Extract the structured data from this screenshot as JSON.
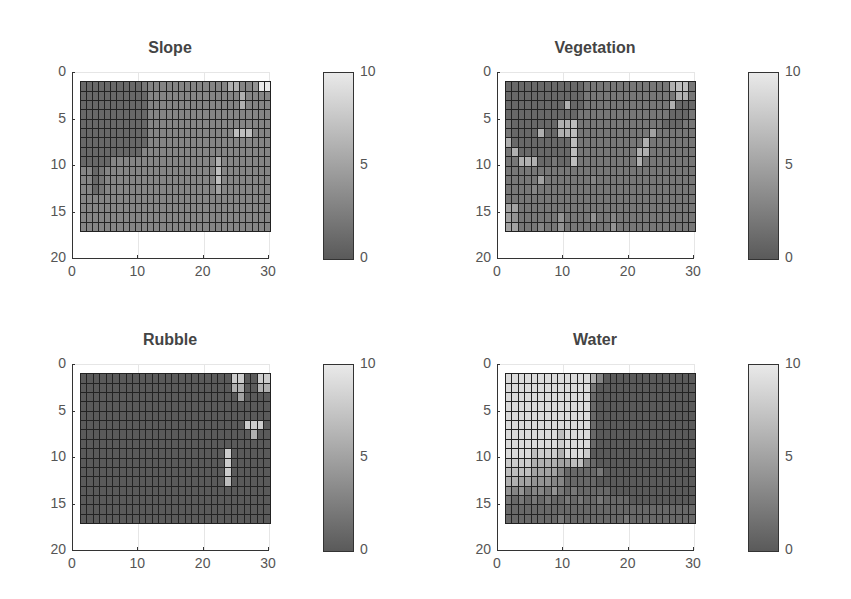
{
  "figure": {
    "panels": [
      {
        "title": "Slope"
      },
      {
        "title": "Vegetation"
      },
      {
        "title": "Rubble"
      },
      {
        "title": "Water"
      }
    ]
  },
  "chart_data": [
    {
      "type": "heatmap",
      "title": "Slope",
      "xlim": [
        0,
        30
      ],
      "ylim": [
        20,
        0
      ],
      "xticks": [
        "0",
        "10",
        "20",
        "30"
      ],
      "yticks": [
        "0",
        "5",
        "10",
        "15",
        "20"
      ],
      "colorbar": {
        "range": [
          0,
          10
        ],
        "ticks": [
          "0",
          "5",
          "10"
        ],
        "colormap": "gray"
      },
      "grid_extent": {
        "x": [
          1,
          30
        ],
        "y": [
          1,
          17
        ]
      },
      "rows": [
        "11111111112333333333333366334aa",
        "1111111111133333333333333363333",
        "1111111111133333333333333363333",
        "1111111111133333333333333333333",
        "1111111111133333333333333333333",
        "1111111111133333333333333777333",
        "1111111111133333333333333333333",
        "1111111111333333333333333333333",
        "1111133333333333333333633333333",
        "3312333333333333333333733333333",
        "3312333333333333333333733333333",
        "3312333333333333333333533333333",
        "3333333333333333333333333333333",
        "3333333333333333333333333333333",
        "3333333333333333333333333333333",
        "3333333333333333333333333333333"
      ]
    },
    {
      "type": "heatmap",
      "title": "Vegetation",
      "xlim": [
        0,
        30
      ],
      "ylim": [
        20,
        0
      ],
      "xticks": [
        "0",
        "10",
        "20",
        "30"
      ],
      "yticks": [
        "0",
        "5",
        "10",
        "15",
        "20"
      ],
      "colorbar": {
        "range": [
          0,
          10
        ],
        "ticks": [
          "0",
          "5",
          "10"
        ],
        "colormap": "gray"
      },
      "grid_extent": {
        "x": [
          1,
          30
        ],
        "y": [
          1,
          17
        ]
      },
      "rows": [
        "11111111111122222222222226772",
        "11111111111122222222222222662",
        "11111111161122222222222226111",
        "11111111111222222222222221112",
        "21111111667222222222222211122",
        "21111611667222222222225222222",
        "61111111117222222222262222222",
        "26111111117222222222662222222",
        "22666112117222222222622222222",
        "22222222222222222222222222222",
        "22222522222223222222222222222",
        "22223222222222222222222222222",
        "22222222222222222222222222222",
        "55222222222222222222222222222",
        "54222222422224223222222222222",
        "55222322422222224222222222222"
      ]
    },
    {
      "type": "heatmap",
      "title": "Rubble",
      "xlim": [
        0,
        30
      ],
      "ylim": [
        20,
        0
      ],
      "xticks": [
        "0",
        "10",
        "20",
        "30"
      ],
      "yticks": [
        "0",
        "5",
        "10",
        "15",
        "20"
      ],
      "colorbar": {
        "range": [
          0,
          10
        ],
        "ticks": [
          "0",
          "5",
          "10"
        ],
        "colormap": "gray"
      },
      "grid_extent": {
        "x": [
          1,
          30
        ],
        "y": [
          1,
          17
        ]
      },
      "rows": [
        "00000000000000000000000880088",
        "00000000000000000000000660066",
        "00000000000000000000000050000",
        "00000000000000000000000000000",
        "00000000000000000000000000000",
        "00000000000000000000000008880",
        "00000000000000000000000000600",
        "00000000000000000000000000000",
        "00000000000000000000008000000",
        "00000000000000000000008000000",
        "00000000000000000000008000000",
        "00000000000000000000007000000",
        "00000000000000000000000000000",
        "00000000000000000000000000000",
        "00000000000000000000000000000",
        "00000000000000000000000000000"
      ]
    },
    {
      "type": "heatmap",
      "title": "Water",
      "xlim": [
        0,
        30
      ],
      "ylim": [
        20,
        0
      ],
      "xticks": [
        "0",
        "10",
        "20",
        "30"
      ],
      "yticks": [
        "0",
        "5",
        "10",
        "15",
        "20"
      ],
      "colorbar": {
        "range": [
          0,
          10
        ],
        "ticks": [
          "0",
          "5",
          "10"
        ],
        "colormap": "gray"
      },
      "grid_extent": {
        "x": [
          1,
          30
        ],
        "y": [
          1,
          17
        ]
      },
      "rows": [
        "99999999999996300000000000000",
        "99999999999992000000000000000",
        "99999999999991000000000000000",
        "99999999999991000000000000000",
        "99999999999991000000000000000",
        "99999999999991000000000000000",
        "99999999799991000000000000000",
        "99999999899991000000000000000",
        "99997888699980000000000000000",
        "88886666557731000000000000000",
        "77775555311111200000000000000",
        "66554443311111000000000000000",
        "43423324212111110000000000000",
        "21212121121211211110000000000",
        "11111111111111111111111111111",
        "11111111211111111121111111111"
      ]
    }
  ]
}
